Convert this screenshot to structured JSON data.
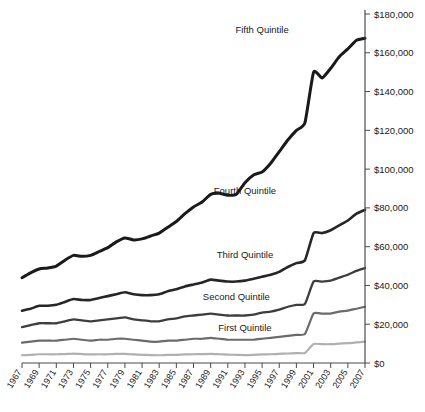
{
  "chart_data": {
    "type": "line",
    "title": "",
    "subtitle": "",
    "xlabel": "",
    "ylabel": "",
    "grid": false,
    "legend_position": "inline-right",
    "y_axis_position": "right",
    "ylim": [
      0,
      180000
    ],
    "ytick_values": [
      0,
      20000,
      40000,
      60000,
      80000,
      100000,
      120000,
      140000,
      160000,
      180000
    ],
    "ytick_labels": [
      "$0",
      "$20,000",
      "$40,000",
      "$60,000",
      "$80,000",
      "$100,000",
      "$120,000",
      "$140,000",
      "$160,000",
      "$180,000"
    ],
    "xlim": [
      1967,
      2007
    ],
    "x": [
      1967,
      1968,
      1969,
      1970,
      1971,
      1972,
      1973,
      1974,
      1975,
      1976,
      1977,
      1978,
      1979,
      1980,
      1981,
      1982,
      1983,
      1984,
      1985,
      1986,
      1987,
      1988,
      1989,
      1990,
      1991,
      1992,
      1993,
      1994,
      1995,
      1996,
      1997,
      1998,
      1999,
      2000,
      2001,
      2002,
      2003,
      2004,
      2005,
      2006,
      2007
    ],
    "xtick_labels": [
      "1967",
      "1969",
      "1971",
      "1973",
      "1975",
      "1977",
      "1979",
      "1981",
      "1983",
      "1985",
      "1987",
      "1989",
      "1991",
      "1993",
      "1995",
      "1997",
      "1999",
      "2001",
      "2003",
      "2005",
      "2007"
    ],
    "series": [
      {
        "name": "Fifth Quintile",
        "color": "#1a1a1a",
        "width": 3.0,
        "label_x": 1995,
        "label_y": 170000,
        "values": [
          44000,
          46500,
          48500,
          49000,
          50000,
          53000,
          55500,
          55000,
          55500,
          57500,
          59500,
          62500,
          64500,
          63500,
          64000,
          65500,
          67000,
          70000,
          73000,
          77000,
          80500,
          83000,
          87000,
          87500,
          86500,
          87000,
          93000,
          97000,
          98500,
          103000,
          109000,
          115000,
          120000,
          124000,
          150000,
          147000,
          152000,
          158000,
          162000,
          166500,
          167500
        ]
      },
      {
        "name": "Fourth Quintile",
        "color": "#262626",
        "width": 2.6,
        "label_x": 1993,
        "label_y": 87000,
        "values": [
          27000,
          28000,
          29500,
          29500,
          30000,
          31500,
          33000,
          32500,
          32500,
          33500,
          34500,
          35500,
          36500,
          35500,
          35000,
          35000,
          35500,
          37000,
          38000,
          39500,
          40500,
          41500,
          43000,
          42500,
          42000,
          42000,
          42500,
          43500,
          44500,
          45500,
          47000,
          49500,
          51500,
          53000,
          67000,
          67000,
          68500,
          71000,
          73500,
          77000,
          79000
        ]
      },
      {
        "name": "Third Quintile",
        "color": "#3d3d3d",
        "width": 2.3,
        "label_x": 1993,
        "label_y": 54000,
        "values": [
          18500,
          19500,
          20500,
          20500,
          20500,
          21500,
          22500,
          22000,
          21500,
          22000,
          22500,
          23000,
          23500,
          22500,
          22000,
          21500,
          21500,
          22500,
          23000,
          24000,
          24500,
          25000,
          25500,
          25000,
          24500,
          24500,
          24500,
          25000,
          26000,
          26500,
          27500,
          29000,
          30000,
          30500,
          42000,
          42000,
          42500,
          44000,
          45500,
          47500,
          49000
        ]
      },
      {
        "name": "Second Quintile",
        "color": "#6b6b6b",
        "width": 2.2,
        "label_x": 1992,
        "label_y": 32500,
        "values": [
          10500,
          11000,
          11500,
          11500,
          11500,
          12000,
          12500,
          12000,
          11500,
          12000,
          12000,
          12500,
          12500,
          12000,
          11500,
          11000,
          11000,
          11500,
          11500,
          12000,
          12500,
          12500,
          13000,
          12500,
          12000,
          12000,
          12000,
          12000,
          12500,
          13000,
          13500,
          14000,
          14500,
          15000,
          25500,
          25500,
          25500,
          26500,
          27000,
          28000,
          29000
        ]
      },
      {
        "name": "First Quintile",
        "color": "#b0b0b0",
        "width": 2.2,
        "label_x": 1993,
        "label_y": 16500,
        "values": [
          4000,
          4200,
          4500,
          4500,
          4500,
          4600,
          4800,
          4600,
          4400,
          4500,
          4500,
          4700,
          4700,
          4400,
          4200,
          4100,
          4000,
          4200,
          4200,
          4400,
          4500,
          4600,
          4700,
          4500,
          4300,
          4200,
          4100,
          4200,
          4400,
          4500,
          4700,
          4900,
          5100,
          5200,
          9800,
          9700,
          9700,
          10000,
          10200,
          10600,
          11000
        ]
      }
    ]
  }
}
